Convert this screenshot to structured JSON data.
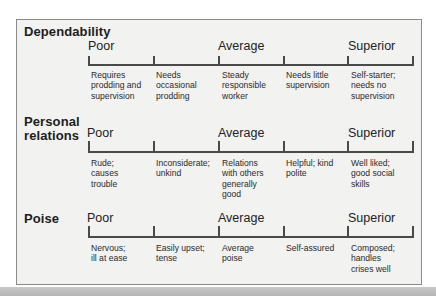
{
  "rating_scale": {
    "levels": [
      "Poor",
      "Average",
      "Superior"
    ],
    "criteria": [
      {
        "title": "Dependability",
        "descriptors": [
          "Requires\nprodding and\nsupervision",
          "Needs\noccasional\nprodding",
          "Steady\nresponsible\nworker",
          "Needs little\nsupervision",
          "Self-starter;\nneeds no\nsupervision"
        ]
      },
      {
        "title": "Personal\nrelations",
        "descriptors": [
          "Rude;\ncauses\ntrouble",
          "Inconsiderate;\nunkind",
          "Relations\nwith others\ngenerally\ngood",
          "Helpful; kind\npolite",
          "Well liked;\ngood social\nskills"
        ]
      },
      {
        "title": "Poise",
        "descriptors": [
          "Nervous;\nill at ease",
          "Easily upset;\ntense",
          "Average\npoise",
          "Self-assured",
          "Composed;\nhandles\ncrises well"
        ]
      }
    ]
  },
  "colors": {
    "panel_bg": "#f2f2f1",
    "panel_border": "#8a8a8a",
    "scale_line": "#4a4a4a",
    "text": "#1a1a1a"
  }
}
